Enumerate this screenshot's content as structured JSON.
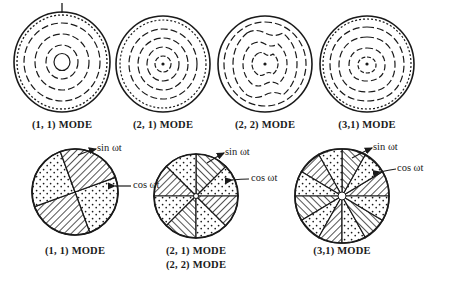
{
  "figure": {
    "background_color": "#ffffff",
    "ink_color": "#1a1a1a",
    "width": 461,
    "height": 296
  },
  "top_row": {
    "description": "Nodal-circle contour patterns for four plate modes",
    "panels": [
      {
        "id": "top-mode-1-1",
        "caption": "(1, 1) MODE",
        "mode_m": 1,
        "mode_n": 1,
        "ring_count": 4,
        "center_dot": false,
        "has_pointer_tick": true,
        "cx": 62,
        "cy": 62,
        "rx": 48,
        "ry": 50
      },
      {
        "id": "top-mode-2-1",
        "caption": "(2, 1) MODE",
        "mode_m": 2,
        "mode_n": 1,
        "ring_count": 4,
        "center_dot": true,
        "has_pointer_tick": false,
        "cx": 163,
        "cy": 64,
        "rx": 47,
        "ry": 48
      },
      {
        "id": "top-mode-2-2",
        "caption": "(2, 2) MODE",
        "mode_m": 2,
        "mode_n": 2,
        "ring_count": 4,
        "center_dot": true,
        "has_pointer_tick": false,
        "cx": 265,
        "cy": 64,
        "rx": 47,
        "ry": 48
      },
      {
        "id": "top-mode-3-1",
        "caption": "(3,1) MODE",
        "mode_m": 3,
        "mode_n": 1,
        "ring_count": 4,
        "center_dot": true,
        "has_pointer_tick": false,
        "cx": 367,
        "cy": 64,
        "rx": 47,
        "ry": 48
      }
    ]
  },
  "bottom_row": {
    "description": "Nodal-diameter sector patterns with sin and cos component labels",
    "panels": [
      {
        "id": "bottom-mode-1-1",
        "captions": [
          "(1, 1) MODE"
        ],
        "sector_count": 4,
        "start_angle_deg": 20,
        "labels": {
          "sin": "sin ωt",
          "cos": "cos ωt"
        },
        "cx": 75,
        "cy": 192,
        "r": 43
      },
      {
        "id": "bottom-mode-2",
        "captions": [
          "(2, 1) MODE",
          "(2, 2) MODE"
        ],
        "sector_count": 8,
        "start_angle_deg": 0,
        "labels": {
          "sin": "sin ωt",
          "cos": "cos ωt"
        },
        "cx": 196,
        "cy": 196,
        "r": 42
      },
      {
        "id": "bottom-mode-3-1",
        "captions": [
          "(3,1) MODE"
        ],
        "sector_count": 12,
        "start_angle_deg": 0,
        "labels": {
          "sin": "sin ωt",
          "cos": "cos ωt"
        },
        "cx": 342,
        "cy": 196,
        "r": 47
      }
    ],
    "legend": {
      "sin_label": "sin ωt",
      "cos_label": "cos ωt",
      "sin_fill": "hatched",
      "cos_fill": "stippled"
    }
  }
}
